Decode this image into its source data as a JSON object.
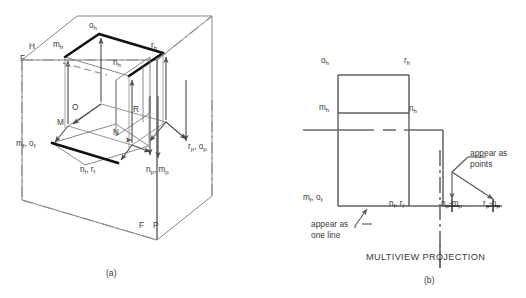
{
  "figure": {
    "title_main": "MULTIVIEW PROJECTION",
    "caption_a": "(a)",
    "caption_b": "(b)",
    "colors": {
      "thin_line": "#6b6b6b",
      "object_line": "#1a1a1a",
      "text": "#3a3a3a",
      "background": "#ffffff"
    }
  },
  "panel_a": {
    "name": "pictorial-glass-box",
    "plane_labels": [
      {
        "id": "plane-h",
        "text": "H",
        "x": 29,
        "y": 48
      },
      {
        "id": "plane-f-top",
        "text": "F",
        "x": 21,
        "y": 60
      },
      {
        "id": "plane-f-bottom",
        "text": "F",
        "x": 140,
        "y": 228
      },
      {
        "id": "plane-p-bottom",
        "text": "P",
        "x": 155,
        "y": 228
      }
    ],
    "vertex_labels": [
      {
        "id": "vertex-o",
        "text": "O",
        "x": 73,
        "y": 110
      },
      {
        "id": "vertex-m",
        "text": "M",
        "x": 58,
        "y": 125
      },
      {
        "id": "vertex-n",
        "text": "N",
        "x": 114,
        "y": 135
      },
      {
        "id": "vertex-r",
        "text": "R",
        "x": 134,
        "y": 112
      }
    ],
    "projection_labels": [
      {
        "id": "label-oh",
        "html": "o<sub>h</sub>",
        "x": 90,
        "y": 27
      },
      {
        "id": "label-mh",
        "html": "m<sub>h</sub>",
        "x": 56,
        "y": 46
      },
      {
        "id": "label-rh",
        "html": "r<sub>h</sub>",
        "x": 152,
        "y": 47
      },
      {
        "id": "label-nh",
        "html": "n<sub>h</sub>",
        "x": 114,
        "y": 64
      },
      {
        "id": "label-mf-of",
        "html": "m<sub>f</sub>, o<sub>f</sub>",
        "x": 19,
        "y": 146
      },
      {
        "id": "label-nf-rf",
        "html": "n<sub>f</sub>, r<sub>f</sub>",
        "x": 82,
        "y": 172
      },
      {
        "id": "label-np-mp",
        "html": "n<sub>p</sub>, m<sub>p</sub>",
        "x": 148,
        "y": 172
      },
      {
        "id": "label-rp-op",
        "html": "r<sub>p</sub>, o<sub>p</sub>",
        "x": 190,
        "y": 149
      }
    ]
  },
  "panel_b": {
    "name": "multiview-projection",
    "labels": [
      {
        "id": "label-oh-b",
        "html": "o<sub>h</sub>",
        "x": 322,
        "y": 62
      },
      {
        "id": "label-rh-b",
        "html": "r<sub>h</sub>",
        "x": 405,
        "y": 62
      },
      {
        "id": "label-mh-b",
        "html": "m<sub>h</sub>",
        "x": 320,
        "y": 109
      },
      {
        "id": "label-nh-b",
        "html": "n<sub>h</sub>",
        "x": 410,
        "y": 110
      },
      {
        "id": "label-mf-of-b",
        "html": "m<sub>f</sub>, o<sub>f</sub>",
        "x": 306,
        "y": 200
      },
      {
        "id": "label-nf-rf-b",
        "html": "n<sub>f</sub>, r<sub>f</sub>",
        "x": 391,
        "y": 206
      },
      {
        "id": "label-np-mp-b",
        "html": "n<sub>p</sub>-m<sub>p</sub>",
        "x": 444,
        "y": 206
      },
      {
        "id": "label-rp-op-b",
        "html": "r<sub>p</sub>-o<sub>p</sub>",
        "x": 485,
        "y": 206
      }
    ],
    "notes": [
      {
        "id": "note-appear-as-points",
        "line1": "appear as",
        "line2": "points",
        "x": 472,
        "y": 153
      },
      {
        "id": "note-appear-as-one-line",
        "line1": "appear as",
        "line2": "one line",
        "x": 312,
        "y": 224,
        "dash_suffix": true
      }
    ]
  }
}
